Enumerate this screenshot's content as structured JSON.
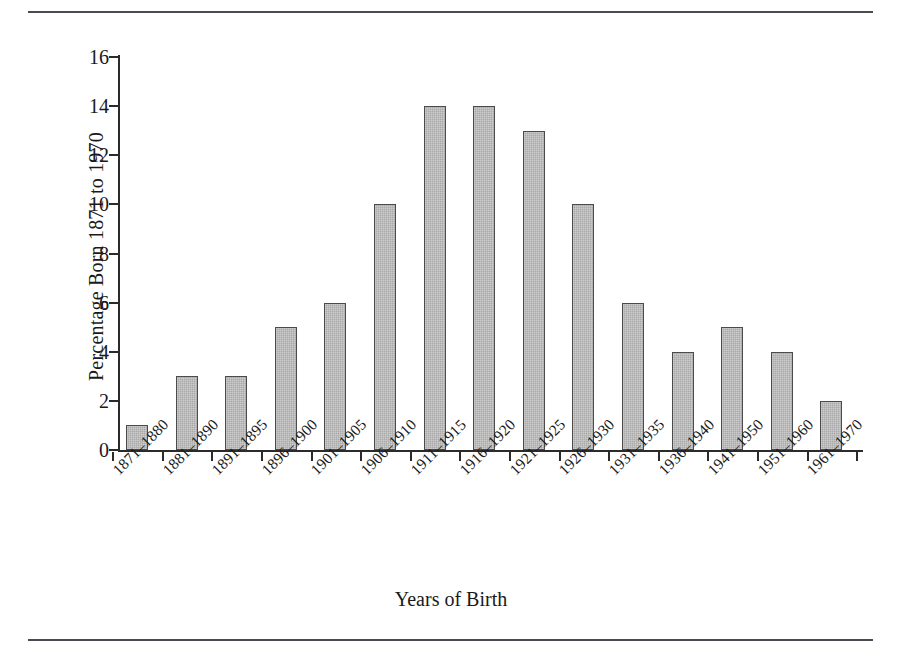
{
  "figure": {
    "top_rule": "horizontal-rule",
    "bottom_rule": "horizontal-rule"
  },
  "chart_data": {
    "type": "bar",
    "title": "",
    "xlabel": "Years of Birth",
    "ylabel": "Percentage Born 1871 to 1970",
    "categories": [
      "1871–1880",
      "1881–1890",
      "1891–1895",
      "1896–1900",
      "1901–1905",
      "1906–1910",
      "1911–1915",
      "1916–1920",
      "1921–1925",
      "1926–1930",
      "1931–1935",
      "1936–1940",
      "1941–1950",
      "1951–1960",
      "1961–1970"
    ],
    "values": [
      1,
      3,
      3,
      5,
      6,
      10,
      14,
      14,
      13,
      10,
      6,
      4,
      5,
      4,
      2
    ],
    "ylim": [
      0,
      16
    ],
    "yticks": [
      0,
      2,
      4,
      6,
      8,
      10,
      12,
      14,
      16
    ],
    "ytick_labels": [
      "0",
      "2",
      "4",
      "6",
      "8",
      "10",
      "12",
      "14",
      "16"
    ],
    "grid": false,
    "legend": null,
    "bar_fill_color": "#a9a9a9",
    "bar_edge_color": "#4b4b4b",
    "axis_color": "#2b2b2b",
    "rule_color": "#4a4a52"
  }
}
